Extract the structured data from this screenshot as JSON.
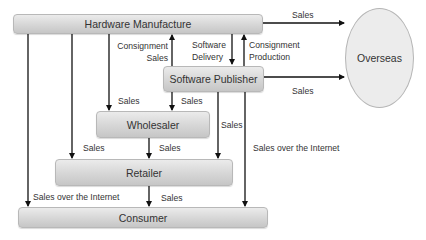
{
  "diagram": {
    "nodes": {
      "hardware_manufacture": "Hardware Manufacture",
      "software_publisher": "Software Publisher",
      "wholesaler": "Wholesaler",
      "retailer": "Retailer",
      "consumer": "Consumer",
      "overseas": "Overseas"
    },
    "labels": {
      "hw_to_overseas": "Sales",
      "consignment_sales_1": "Consignment",
      "consignment_sales_2": "Sales",
      "software_delivery_1": "Software",
      "software_delivery_2": "Delivery",
      "consignment_production_1": "Consignment",
      "consignment_production_2": "Production",
      "sp_to_overseas": "Sales",
      "hw_to_wholesaler": "Sales",
      "sp_to_wholesaler": "Sales",
      "sp_to_retailer": "Sales",
      "sp_to_consumer": "Sales over the Internet",
      "hw_to_retailer": "Sales",
      "wholesaler_to_retailer": "Sales",
      "hw_to_consumer": "Sales over the Internet",
      "retailer_to_consumer": "Sales"
    },
    "edges": [
      {
        "from": "Hardware Manufacture",
        "to": "Overseas",
        "label": "Sales"
      },
      {
        "from": "Software Publisher",
        "to": "Hardware Manufacture",
        "label": "Consignment Sales"
      },
      {
        "from": "Hardware Manufacture",
        "to": "Software Publisher",
        "label": "Software Delivery"
      },
      {
        "from": "Software Publisher",
        "to": "Hardware Manufacture",
        "label": "Consignment Production"
      },
      {
        "from": "Software Publisher",
        "to": "Overseas",
        "label": "Sales"
      },
      {
        "from": "Hardware Manufacture",
        "to": "Wholesaler",
        "label": "Sales"
      },
      {
        "from": "Software Publisher",
        "to": "Wholesaler",
        "label": "Sales"
      },
      {
        "from": "Software Publisher",
        "to": "Retailer",
        "label": "Sales"
      },
      {
        "from": "Software Publisher",
        "to": "Consumer",
        "label": "Sales over the Internet"
      },
      {
        "from": "Hardware Manufacture",
        "to": "Retailer",
        "label": "Sales"
      },
      {
        "from": "Wholesaler",
        "to": "Retailer",
        "label": "Sales"
      },
      {
        "from": "Hardware Manufacture",
        "to": "Consumer",
        "label": "Sales over the Internet"
      },
      {
        "from": "Retailer",
        "to": "Consumer",
        "label": "Sales"
      }
    ]
  }
}
